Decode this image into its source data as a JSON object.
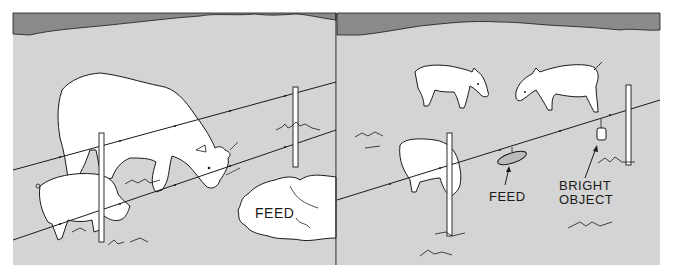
{
  "figure": {
    "colors": {
      "ground": "#d4d4d4",
      "sky": "#8a8a8a",
      "outline": "#1a1a1a",
      "animal_fill": "#ffffff",
      "page": "#ffffff"
    },
    "panels": [
      {
        "id": "left",
        "description": "Cow and pig reaching under electric fence wire toward feed pile",
        "animals": [
          "cow",
          "pig"
        ],
        "labels": {
          "feed": "FEED"
        }
      },
      {
        "id": "right",
        "description": "Goats and sheep with feed tray and bright object hung on fence wire",
        "animals": [
          "goat",
          "goat",
          "sheep"
        ],
        "labels": {
          "feed": "FEED",
          "bright_object_line1": "BRIGHT",
          "bright_object_line2": "OBJECT"
        }
      }
    ]
  }
}
